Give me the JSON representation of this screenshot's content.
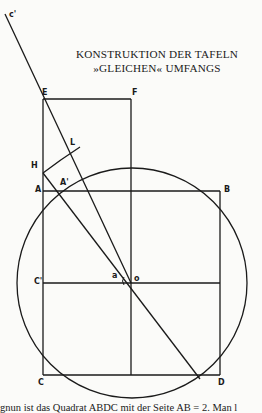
{
  "title": {
    "line1": "KONSTRUKTION DER TAFELN",
    "line2": "»GLEICHEN« UMFANGS"
  },
  "labels": {
    "c_prime_top": "c'",
    "E": "E",
    "F": "F",
    "L": "L",
    "H": "H",
    "A_prime": "A'",
    "A": "A",
    "B": "B",
    "C_prime": "C'",
    "alpha": "a",
    "O": "o",
    "C": "C",
    "D": "D"
  },
  "caption": "gnun ist das Quadrat ABDC mit der Seite AB = 2. Man l",
  "colors": {
    "ink": "#1a1a1a",
    "paper": "#fbfbf9"
  }
}
